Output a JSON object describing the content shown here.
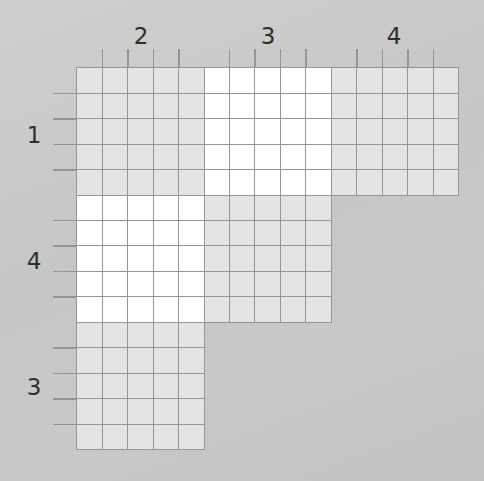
{
  "puzzle": {
    "type": "logic-grid",
    "groups": 3,
    "group_size": 5,
    "column_clues": [
      "2",
      "3",
      "4"
    ],
    "row_clues": [
      "1",
      "4",
      "3"
    ],
    "blocks": [
      {
        "row_group": 0,
        "col_group": 0,
        "shade": "light"
      },
      {
        "row_group": 0,
        "col_group": 1,
        "shade": "white"
      },
      {
        "row_group": 0,
        "col_group": 2,
        "shade": "light"
      },
      {
        "row_group": 1,
        "col_group": 0,
        "shade": "white"
      },
      {
        "row_group": 1,
        "col_group": 1,
        "shade": "light"
      },
      {
        "row_group": 2,
        "col_group": 0,
        "shade": "light"
      }
    ]
  },
  "colors": {
    "background": "#c8c8c8",
    "light_cell": "#e4e4e4",
    "white_cell": "#ffffff",
    "grid_line": "#959595",
    "clue_text": "#2e2e2e"
  }
}
